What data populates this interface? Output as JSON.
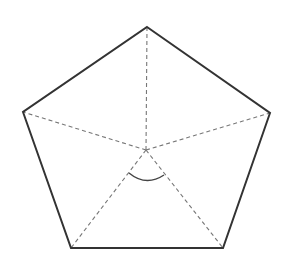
{
  "diagram": {
    "type": "regular-pentagon-central-angle",
    "background": "#ffffff",
    "stroke_color": "#333333",
    "dash_color": "#777777",
    "center": [
      146,
      150
    ],
    "vertices": [
      [
        147,
        27
      ],
      [
        270,
        113
      ],
      [
        223,
        248
      ],
      [
        71,
        248
      ],
      [
        23,
        112
      ]
    ],
    "outline_points": "147,27 270,113 223,248 71,248 23,112",
    "radii": [
      {
        "x2": 147,
        "y2": 27
      },
      {
        "x2": 270,
        "y2": 113
      },
      {
        "x2": 223,
        "y2": 248
      },
      {
        "x2": 71,
        "y2": 248
      },
      {
        "x2": 23,
        "y2": 112
      }
    ],
    "angle_arc": "M129,173 Q146,187 164,175"
  }
}
